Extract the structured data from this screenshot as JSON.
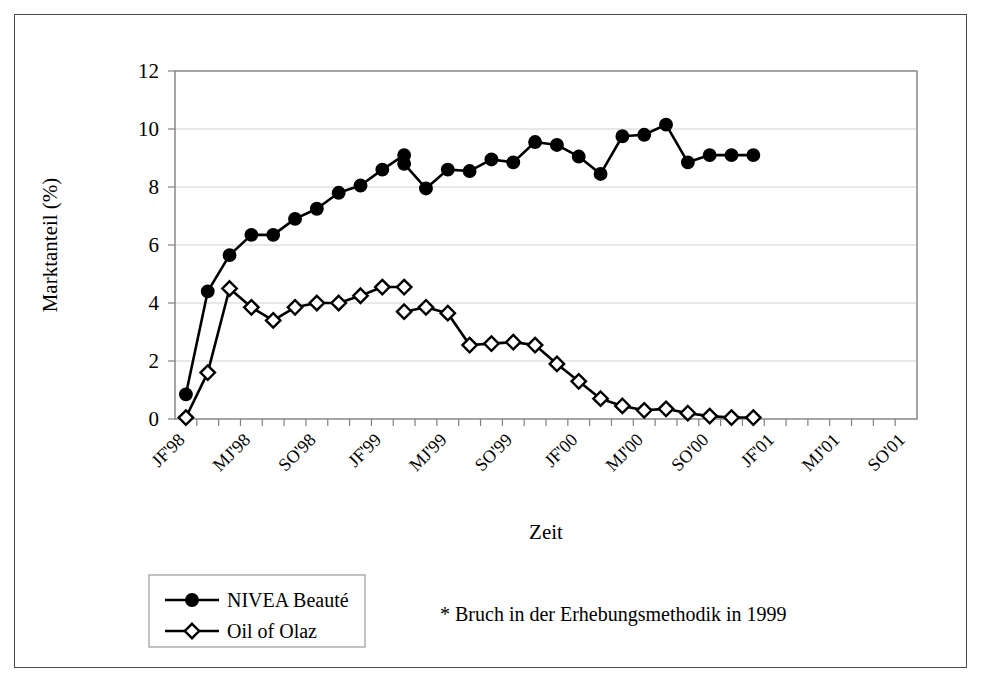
{
  "figure": {
    "border_color": "#4a4a4a"
  },
  "chart_data": {
    "type": "line",
    "title": "",
    "xlabel": "Zeit",
    "ylabel": "Marktanteil (%)",
    "ylim": [
      0,
      12
    ],
    "yticks": [
      0,
      2,
      4,
      6,
      8,
      10,
      12
    ],
    "ytick_labels": [
      "0",
      "2",
      "4",
      "6",
      "8",
      "10",
      "12"
    ],
    "grid": "horizontal",
    "legend_position": "below-left",
    "x_count": 24,
    "x_tick_labels": [
      "JF'98",
      "MJ'98",
      "SO'98",
      "JF'99",
      "MJ'99",
      "SO'99",
      "JF'00",
      "MJ'00",
      "SO'00",
      "JF'01",
      "MJ'01",
      "SO'01"
    ],
    "x_tick_label_indices": [
      0,
      3,
      6,
      9,
      12,
      15,
      18,
      21,
      24,
      27,
      30,
      33
    ],
    "x_labels_rotated": true,
    "annotation": "* Bruch in der Erhebungsmethodik in 1999",
    "series": [
      {
        "name": "NIVEA Beauté",
        "marker": "filled-circle",
        "segments": [
          {
            "x": [
              0,
              1,
              2,
              3,
              4,
              5,
              6,
              7,
              8,
              9,
              10
            ],
            "values": [
              0.85,
              4.4,
              5.65,
              6.35,
              6.35,
              6.9,
              7.25,
              7.8,
              8.05,
              8.6,
              9.1
            ]
          },
          {
            "x": [
              10,
              11,
              12,
              13,
              14,
              15,
              16,
              17,
              18,
              19,
              20,
              21,
              22,
              23,
              24,
              25,
              26
            ],
            "values": [
              8.8,
              7.95,
              8.6,
              8.55,
              8.95,
              8.85,
              9.55,
              9.45,
              9.05,
              8.45,
              9.75,
              9.8,
              10.15,
              8.85,
              9.1,
              9.1,
              9.1
            ]
          }
        ]
      },
      {
        "name": "Oil of Olaz",
        "marker": "open-diamond",
        "segments": [
          {
            "x": [
              0,
              1,
              2,
              3,
              4,
              5,
              6,
              7,
              8,
              9,
              10
            ],
            "values": [
              0.05,
              1.6,
              4.5,
              3.85,
              3.4,
              3.85,
              4.0,
              4.0,
              4.25,
              4.55,
              4.55
            ]
          },
          {
            "x": [
              10,
              11,
              12,
              13,
              14,
              15,
              16,
              17,
              18,
              19,
              20,
              21,
              22,
              23,
              24,
              25,
              26
            ],
            "values": [
              3.7,
              3.85,
              3.65,
              2.55,
              2.6,
              2.65,
              2.55,
              1.9,
              1.3,
              0.7,
              0.45,
              0.3,
              0.35,
              0.2,
              0.1,
              0.05,
              0.05
            ]
          }
        ]
      }
    ]
  },
  "legend": {
    "entries": [
      {
        "label": "NIVEA Beauté",
        "marker": "filled-circle"
      },
      {
        "label": "Oil of Olaz",
        "marker": "open-diamond"
      }
    ]
  }
}
